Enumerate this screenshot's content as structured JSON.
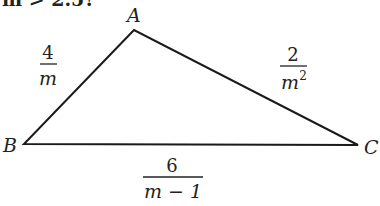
{
  "header_fragment": "m > 2.5?",
  "triangle": {
    "vertices": [
      {
        "name": "A",
        "x": 134,
        "y": 30
      },
      {
        "name": "B",
        "x": 24,
        "y": 144
      },
      {
        "name": "C",
        "x": 358,
        "y": 145
      }
    ],
    "labels": {
      "A": "A",
      "B": "B",
      "C": "C"
    },
    "sides": {
      "AB": {
        "numerator": "4",
        "denominator": "m"
      },
      "AC": {
        "numerator": "2",
        "denominator": "m",
        "denominator_exponent": "2"
      },
      "BC": {
        "numerator": "6",
        "denominator": "m − 1"
      }
    },
    "stroke_color": "#1a1a1a"
  }
}
